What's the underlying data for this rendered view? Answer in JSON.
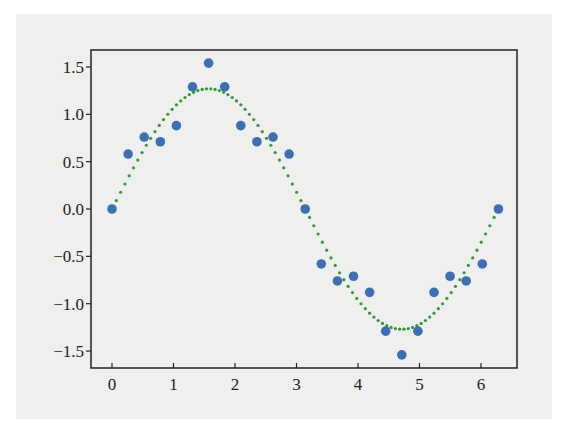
{
  "chart_data": {
    "type": "scatter",
    "title": "",
    "xlabel": "",
    "ylabel": "",
    "xlim": [
      -0.35,
      6.6
    ],
    "ylim": [
      -1.7,
      1.7
    ],
    "x_ticks": [
      0,
      1,
      2,
      3,
      4,
      5,
      6
    ],
    "x_tick_labels": [
      "0",
      "1",
      "2",
      "3",
      "4",
      "5",
      "6"
    ],
    "y_ticks": [
      1.5,
      1.0,
      0.5,
      0.0,
      -0.5,
      -1.0,
      -1.5
    ],
    "y_tick_labels": [
      "1.5",
      "1.0",
      "0.5",
      "0.0",
      "−0.5",
      "−1.0",
      "−1.5"
    ],
    "grid": false,
    "legend": "none",
    "series": [
      {
        "name": "points",
        "kind": "scatter",
        "color": "#3b6fb6",
        "x": [
          0,
          0.2618,
          0.5236,
          0.7854,
          1.0472,
          1.309,
          1.5708,
          1.8326,
          2.0944,
          2.3562,
          2.618,
          2.8798,
          3.1416,
          3.4034,
          3.6652,
          3.927,
          4.1888,
          4.4506,
          4.7124,
          4.9742,
          5.236,
          5.4978,
          5.7596,
          6.0214,
          6.2832
        ],
        "y": [
          0.0,
          0.58,
          0.76,
          0.71,
          0.88,
          1.29,
          1.54,
          1.29,
          0.88,
          0.71,
          0.76,
          0.58,
          0.0,
          -0.58,
          -0.76,
          -0.71,
          -0.88,
          -1.29,
          -1.54,
          -1.29,
          -0.88,
          -0.71,
          -0.76,
          -0.58,
          0.0
        ]
      },
      {
        "name": "fit",
        "kind": "line",
        "style": "dotted",
        "color": "#2e9a3a",
        "function": "1.27*sin(x)",
        "x_range": [
          0,
          6.2832
        ]
      }
    ]
  },
  "colors": {
    "figure_background": "#efefed",
    "axes_frame": "#222222"
  }
}
